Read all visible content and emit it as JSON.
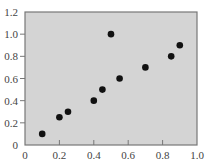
{
  "chart_data": {
    "type": "scatter",
    "title": "",
    "xlabel": "",
    "ylabel": "",
    "xlim": [
      0,
      1.0
    ],
    "ylim": [
      0,
      1.2
    ],
    "x_ticks": [
      0,
      0.2,
      0.4,
      0.6,
      0.8,
      1.0
    ],
    "x_tick_labels": [
      "0",
      "0.2",
      "0.4",
      "0.6",
      "0.8",
      "1.0"
    ],
    "y_ticks": [
      0,
      0.2,
      0.4,
      0.6,
      0.8,
      1.0,
      1.2
    ],
    "y_tick_labels": [
      "0",
      "0.2",
      "0.4",
      "0.6",
      "0.8",
      "1.0",
      "1.2"
    ],
    "grid": false,
    "legend": null,
    "series": [
      {
        "name": "points",
        "x": [
          0.1,
          0.2,
          0.25,
          0.4,
          0.45,
          0.5,
          0.55,
          0.7,
          0.85,
          0.9
        ],
        "y": [
          0.1,
          0.25,
          0.3,
          0.4,
          0.5,
          1.0,
          0.6,
          0.7,
          0.8,
          0.9
        ]
      }
    ]
  },
  "colors": {
    "plot_background": "#d4d4d4",
    "axis_border": "#777777",
    "marker": "#111111",
    "tick_label": "#444444"
  }
}
